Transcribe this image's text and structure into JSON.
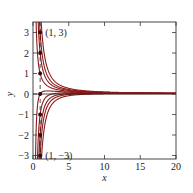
{
  "chart_data": {
    "type": "line",
    "title": "",
    "xlabel": "x",
    "ylabel": "y",
    "xlim": [
      0,
      20
    ],
    "ylim": [
      -3.4,
      3.5
    ],
    "xticks": [
      0,
      5,
      10,
      15,
      20
    ],
    "yticks": [
      -3,
      -2,
      -1,
      0,
      1,
      2,
      3
    ],
    "grid": false,
    "legend": null,
    "curve_color": "#8b1a1a",
    "series": [
      {
        "name": "through (1,3)",
        "initial": [
          1,
          3
        ]
      },
      {
        "name": "through (1,2)",
        "initial": [
          1,
          2
        ]
      },
      {
        "name": "through (1,1)",
        "initial": [
          1,
          1
        ]
      },
      {
        "name": "through (1,0)",
        "initial": [
          1,
          0
        ]
      },
      {
        "name": "through (1,-1)",
        "initial": [
          1,
          -1
        ]
      },
      {
        "name": "through (1,-2)",
        "initial": [
          1,
          -2
        ]
      },
      {
        "name": "through (1,-3)",
        "initial": [
          1,
          -3
        ]
      }
    ],
    "points": [
      [
        1,
        3
      ],
      [
        1,
        2
      ],
      [
        1,
        1
      ],
      [
        1,
        0
      ],
      [
        1,
        -1
      ],
      [
        1,
        -2
      ],
      [
        1,
        -3
      ]
    ],
    "annotations": [
      {
        "text": "(1, 3)",
        "x": 1,
        "y": 3
      },
      {
        "text": "(1, −3)",
        "x": 1,
        "y": -3
      }
    ],
    "dashed_line_x": 1
  }
}
